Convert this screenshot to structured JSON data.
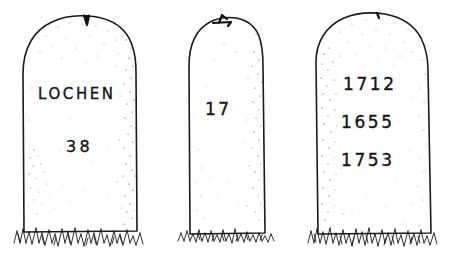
{
  "artwork": {
    "title": "Three Inscribed Stones",
    "medium": "pen-and-ink line drawing",
    "background_color": "#ffffff",
    "ink_color": "#1a1a1a",
    "width": 450,
    "height": 253
  },
  "stones": [
    {
      "id": "stone-left",
      "position": "left",
      "top_mark": "notch",
      "inscriptions": [
        {
          "id": "lochen",
          "text": "LOCHEN",
          "line": 1
        },
        {
          "id": "thirty-eight",
          "text": "38",
          "line": 2
        }
      ]
    },
    {
      "id": "stone-middle",
      "position": "middle",
      "top_mark": "chip",
      "inscriptions": [
        {
          "id": "seventeen",
          "text": "17",
          "line": 1
        }
      ]
    },
    {
      "id": "stone-right",
      "position": "right",
      "top_mark": "nick",
      "inscriptions": [
        {
          "id": "year-1712",
          "text": "1712",
          "line": 1
        },
        {
          "id": "year-1655",
          "text": "1655",
          "line": 2
        },
        {
          "id": "year-1753",
          "text": "1753",
          "line": 3
        }
      ]
    }
  ],
  "ground": {
    "id": "grass",
    "label": "grass tufts"
  }
}
